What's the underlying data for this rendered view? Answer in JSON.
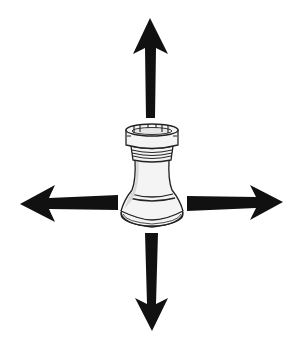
{
  "diagram": {
    "piece": "rook",
    "directions": [
      "up",
      "down",
      "left",
      "right"
    ],
    "colors": {
      "background": "#ffffff",
      "arrow": "#111111",
      "outline": "#222222",
      "piece_fill": "#f4f4f4",
      "piece_shade": "#d8d8d8"
    }
  }
}
